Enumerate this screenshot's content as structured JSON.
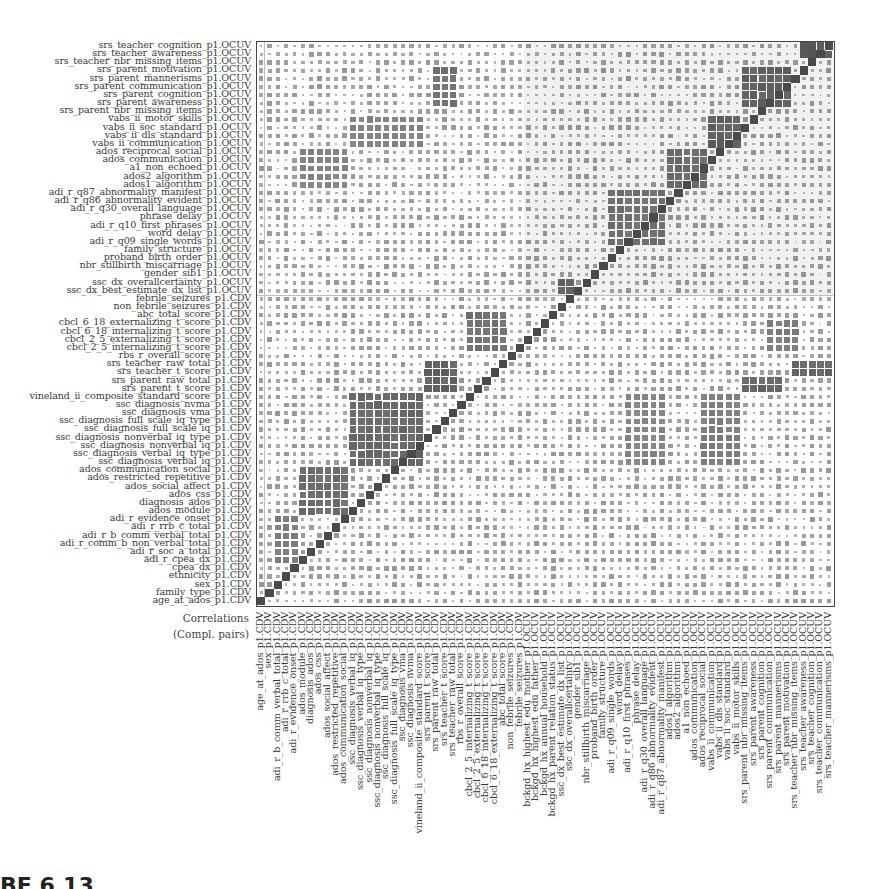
{
  "chart_data": {
    "type": "heatmap",
    "title": "",
    "caption_lines": [
      "Correlations",
      "(Compl. pairs)"
    ],
    "encoding": "square size and darkness proportional to absolute correlation; diagonal = 1",
    "row_labels": [
      "srs_teacher_cognition_p1.OCUV",
      "srs_teacher_awareness_p1.OCUV",
      "srs_teacher_nbr_missing_items_p1.OCUV",
      "srs_parent_motivation_p1.OCUV",
      "srs_parent_mannerisms_p1.OCUV",
      "srs_parent_communication_p1.OCUV",
      "srs_parent_cognition_p1.OCUV",
      "srs_parent_awareness_p1.OCUV",
      "srs_parent_nbr_missing_items_p1.OCUV",
      "vabs_ii_motor_skills_p1.OCUV",
      "vabs_ii_soc_standard_p1.OCUV",
      "vabs_ii_dls_standard_p1.OCUV",
      "vabs_ii_communication_p1.OCUV",
      "ados_reciprocal_social_p1.OCUV",
      "ados_communication_p1.OCUV",
      "a1_non_echoed_p1.OCUV",
      "ados2_algorithm_p1.OCUV",
      "ados1_algorithm_p1.OCUV",
      "adi_r_q87_abnormality_manifest_p1.OCUV",
      "adi_r_q86_abnormality_evident_p1.OCUV",
      "adi_r_q30_overall_language_p1.OCUV",
      "phrase_delay_p1.OCUV",
      "adi_r_q10_first_phrases_p1.OCUV",
      "word_delay_p1.OCUV",
      "adi_r_q09_single_words_p1.OCUV",
      "family_structure_p1.OCUV",
      "proband_birth_order_p1.OCUV",
      "nbr_stillbirth_miscarriage_p1.OCUV",
      "gender_sib1_p1.OCUV",
      "ssc_dx_overallcertainty_p1.OCUV",
      "ssc_dx_best_estimate_dx_list_p1.OCUV",
      "febrile_seizures_p1.CDV",
      "non_febrile_seizures_p1.CDV",
      "abc_total_score_p1.CDV",
      "cbcl_6_18_externalizing_t_score_p1.CDV",
      "cbcl_6_18_internalizing_t_score_p1.CDV",
      "cbcl_2_5_externalizing_t_score_p1.CDV",
      "cbcl_2_5_internalizing_t_score_p1.CDV",
      "rbs_r_overall_score_p1.CDV",
      "srs_teacher_raw_total_p1.CDV",
      "srs_teacher_t_score_p1.CDV",
      "srs_parent_raw_total_p1.CDV",
      "srs_parent_t_score_p1.CDV",
      "vineland_ii_composite_standard_score_p1.CDV",
      "ssc_diagnosis_nvma_p1.CDV",
      "ssc_diagnosis_vma_p1.CDV",
      "ssc_diagnosis_full_scale_iq_type_p1.CDV",
      "ssc_diagnosis_full_scale_iq_p1.CDV",
      "ssc_diagnosis_nonverbal_iq_type_p1.CDV",
      "ssc_diagnosis_nonverbal_iq_p1.CDV",
      "ssc_diagnosis_verbal_iq_type_p1.CDV",
      "ssc_diagnosis_verbal_iq_p1.CDV",
      "ados_communication_social_p1.CDV",
      "ados_restricted_repetitive_p1.CDV",
      "ados_social_affect_p1.CDV",
      "ados_css_p1.CDV",
      "diagnosis_ados_p1.CDV",
      "ados_module_p1.CDV",
      "adi_r_evidence_onset_p1.CDV",
      "adi_r_rrb_c_total_p1.CDV",
      "adi_r_b_comm_verbal_total_p1.CDV",
      "adi_r_comm_b_non_verbal_total_p1.CDV",
      "adi_r_soc_a_total_p1.CDV",
      "adi_r_cpea_dx_p1.CDV",
      "cpea_dx_p1.CDV",
      "ethnicity_p1.CDV",
      "sex_p1.CDV",
      "family_type_p1.CDV",
      "age_at_ados_p1.CDV"
    ],
    "col_labels": [
      "age_at_ados_p1.CDV",
      "sex_p1.CDV",
      "adi_r_b_comm_verbal_total_p1.CDV",
      "adi_r_rrb_c_total_p1.CDV",
      "adi_r_evidence_onset_p1.CDV",
      "ados_module_p1.CDV",
      "diagnosis_ados_p1.CDV",
      "ados_css_p1.CDV",
      "ados_social_affect_p1.CDV",
      "ados_restricted_repetitive_p1.CDV",
      "ados_communication_social_p1.CDV",
      "ssc_diagnosis_verbal_iq_p1.CDV",
      "ssc_diagnosis_verbal_iq_type_p1.CDV",
      "ssc_diagnosis_nonverbal_iq_p1.CDV",
      "ssc_diagnosis_nonverbal_iq_type_p1.CDV",
      "ssc_diagnosis_full_scale_iq_p1.CDV",
      "ssc_diagnosis_full_scale_iq_type_p1.CDV",
      "ssc_diagnosis_vma_p1.CDV",
      "ssc_diagnosis_nvma_p1.CDV",
      "vineland_ii_composite_standard_score_p1.CDV",
      "srs_parent_t_score_p1.CDV",
      "srs_parent_raw_total_p1.CDV",
      "srs_teacher_t_score_p1.CDV",
      "srs_teacher_raw_total_p1.CDV",
      "rbs_r_overall_score_p1.CDV",
      "cbcl_2_5_internalizing_t_score_p1.CDV",
      "cbcl_2_5_externalizing_t_score_p1.CDV",
      "cbcl_6_18_internalizing_t_score_p1.CDV",
      "cbcl_6_18_externalizing_t_score_p1.CDV",
      "abc_total_score_p1.CDV",
      "non_febrile_seizures_p1.CDV",
      "febrile_seizures_p1.CDV",
      "bckgd_hx_highest_edu_mother_p1.OCUV",
      "bckgd_hx_highest_edu_father_p1.OCUV",
      "bckgd_hx_annual_household_p1.OCUV",
      "bckgd_hx_parent_relation_status_p1.OCUV",
      "ssc_dx_best_estimate_dx_list_p1.OCUV",
      "ssc_dx_overallcertainty_p1.OCUV",
      "gender_sib1_p1.OCUV",
      "nbr_stillbirth_miscarriage_p1.OCUV",
      "proband_birth_order_p1.OCUV",
      "family_structure_p1.OCUV",
      "adi_r_q09_single_words_p1.OCUV",
      "word_delay_p1.OCUV",
      "adi_r_q10_first_phrases_p1.OCUV",
      "phrase_delay_p1.OCUV",
      "adi_r_q30_overall_language_p1.OCUV",
      "adi_r_q86_abnormality_evident_p1.OCUV",
      "adi_r_q87_abnormality_manifest_p1.OCUV",
      "ados1_algorithm_p1.OCUV",
      "ados2_algorithm_p1.OCUV",
      "a1_non_echoed_p1.OCUV",
      "ados_communication_p1.OCUV",
      "ados_reciprocal_social_p1.OCUV",
      "vabs_ii_communication_p1.OCUV",
      "vabs_ii_dls_standard_p1.OCUV",
      "vabs_ii_soc_standard_p1.OCUV",
      "vabs_ii_motor_skills_p1.OCUV",
      "srs_parent_nbr_missing_items_p1.OCUV",
      "srs_parent_awareness_p1.OCUV",
      "srs_parent_cognition_p1.OCUV",
      "srs_parent_communication_p1.OCUV",
      "srs_parent_mannerisms_p1.OCUV",
      "srs_parent_motivation_p1.OCUV",
      "srs_teacher_nbr_missing_items_p1.OCUV",
      "srs_teacher_awareness_p1.OCUV",
      "srs_teacher_cognition_p1.OCUV",
      "srs_teacher_communication_p1.OCUV",
      "srs_teacher_mannerisms_p1.OCUV"
    ],
    "groups": {
      "ocuv_rows": 31,
      "cdv_rows": 38,
      "ocuv_cols": 37,
      "cdv_cols": 32
    },
    "strong_blocks": [
      {
        "name": "srs_teacher subscales",
        "rows": [
          0,
          1
        ],
        "cols": [
          65,
          68
        ],
        "value": 0.9
      },
      {
        "name": "srs_parent subscales",
        "rows": [
          3,
          7
        ],
        "cols": [
          58,
          63
        ],
        "value": 0.85
      },
      {
        "name": "vabs_ii scales",
        "rows": [
          9,
          12
        ],
        "cols": [
          54,
          57
        ],
        "value": 0.85
      },
      {
        "name": "ados algorithm items",
        "rows": [
          13,
          17
        ],
        "cols": [
          49,
          53
        ],
        "value": 0.75
      },
      {
        "name": "adi_r language items",
        "rows": [
          18,
          24
        ],
        "cols": [
          42,
          48
        ],
        "value": 0.7
      },
      {
        "name": "ssc_dx",
        "rows": [
          29,
          30
        ],
        "cols": [
          36,
          37
        ],
        "value": 0.85
      },
      {
        "name": "cbcl scores",
        "rows": [
          33,
          37
        ],
        "cols": [
          25,
          29
        ],
        "value": 0.7
      },
      {
        "name": "srs totals",
        "rows": [
          39,
          42
        ],
        "cols": [
          20,
          23
        ],
        "value": 0.85
      },
      {
        "name": "ssc cognitive",
        "rows": [
          43,
          51
        ],
        "cols": [
          11,
          19
        ],
        "value": 0.8
      },
      {
        "name": "ados calibrated",
        "rows": [
          52,
          57
        ],
        "cols": [
          5,
          10
        ],
        "value": 0.75
      },
      {
        "name": "adi_r totals",
        "rows": [
          58,
          63
        ],
        "cols": [
          2,
          4
        ],
        "value": 0.6
      }
    ],
    "off_diagonal_blocks": [
      {
        "rows": [
          34,
          37
        ],
        "cols": [
          61,
          64
        ],
        "value": 0.6
      },
      {
        "rows": [
          39,
          40
        ],
        "cols": [
          64,
          68
        ],
        "value": 0.8
      },
      {
        "rows": [
          41,
          42
        ],
        "cols": [
          58,
          62
        ],
        "value": 0.8
      },
      {
        "rows": [
          43,
          51
        ],
        "cols": [
          44,
          48
        ],
        "value": 0.55
      },
      {
        "rows": [
          43,
          51
        ],
        "cols": [
          53,
          57
        ],
        "value": 0.6
      },
      {
        "rows": [
          3,
          7
        ],
        "cols": [
          21,
          23
        ],
        "value": 0.7
      },
      {
        "rows": [
          9,
          12
        ],
        "cols": [
          11,
          19
        ],
        "value": 0.55
      },
      {
        "rows": [
          13,
          17
        ],
        "cols": [
          5,
          10
        ],
        "value": 0.55
      }
    ],
    "value_range": [
      0,
      1
    ],
    "grid": false,
    "legend": "none"
  },
  "page": {
    "fragment_text": "BE 6.13"
  },
  "style": {
    "cell_color": "#4a4a4a",
    "ocuv_shade": "#f1f1f1",
    "frame_color": "#444444",
    "divider_color": "#bdbdbd"
  }
}
